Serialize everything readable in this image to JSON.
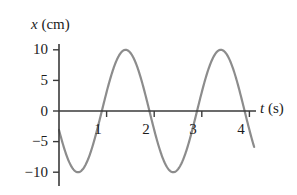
{
  "figure": {
    "background_color": "#ffffff",
    "axis_color": "#3a3a3a",
    "curve_color": "#8c8c8c",
    "text_color": "#1c1c1c"
  },
  "labels": {
    "y_axis_var": "x",
    "y_axis_unit": "(cm)",
    "x_axis_var": "t",
    "x_axis_unit": "(s)"
  },
  "chart_data": {
    "type": "line",
    "title": "",
    "subtitle": "",
    "xlabel": "t (s)",
    "ylabel": "x (cm)",
    "xlim": [
      0,
      4.15
    ],
    "ylim": [
      -11.5,
      11.5
    ],
    "grid": false,
    "legend": null,
    "xticks": [
      1,
      2,
      3,
      4
    ],
    "xtick_labels": [
      "1",
      "2",
      "3",
      "4"
    ],
    "yticks": [
      10,
      5,
      0,
      -5,
      -10
    ],
    "ytick_labels": [
      "10",
      "5",
      "0",
      "−5",
      "−10"
    ],
    "series": [
      {
        "name": "x(t)",
        "equation": "x = 10 sin(π(t − 0.9))",
        "amplitude": 10,
        "period": 2,
        "phase_t_of_first_minimum": 0.4,
        "x": [
          0.0,
          0.1,
          0.2,
          0.3,
          0.4,
          0.5,
          0.6,
          0.7,
          0.8,
          0.9,
          1.0,
          1.1,
          1.2,
          1.3,
          1.4,
          1.5,
          1.6,
          1.7,
          1.8,
          1.9,
          2.0,
          2.1,
          2.2,
          2.3,
          2.4,
          2.5,
          2.6,
          2.7,
          2.8,
          2.9,
          3.0,
          3.1,
          3.2,
          3.3,
          3.4,
          3.5,
          3.6,
          3.7,
          3.8,
          3.9,
          4.0,
          4.1
        ],
        "values": [
          -5.9,
          -8.1,
          -9.5,
          -10.0,
          -9.5,
          -8.1,
          -5.9,
          -3.1,
          0.0,
          3.1,
          5.9,
          8.1,
          9.5,
          10.0,
          9.5,
          8.1,
          5.9,
          3.1,
          0.0,
          -3.1,
          -5.9,
          -8.1,
          -9.5,
          -10.0,
          -9.5,
          -8.1,
          -5.9,
          -3.1,
          0.0,
          3.1,
          5.9,
          8.1,
          9.5,
          10.0,
          9.5,
          8.1,
          5.9,
          3.1,
          0.0,
          -3.1,
          -5.9,
          -7.2
        ]
      }
    ],
    "annotations": {
      "maxima_t": [
        1.4,
        3.4
      ],
      "minima_t": [
        0.4,
        2.4
      ],
      "zero_crossings_t": [
        0.9,
        1.9,
        2.9,
        3.9
      ],
      "start_value_cm": -5.9,
      "end_value_cm": -7.2
    }
  }
}
